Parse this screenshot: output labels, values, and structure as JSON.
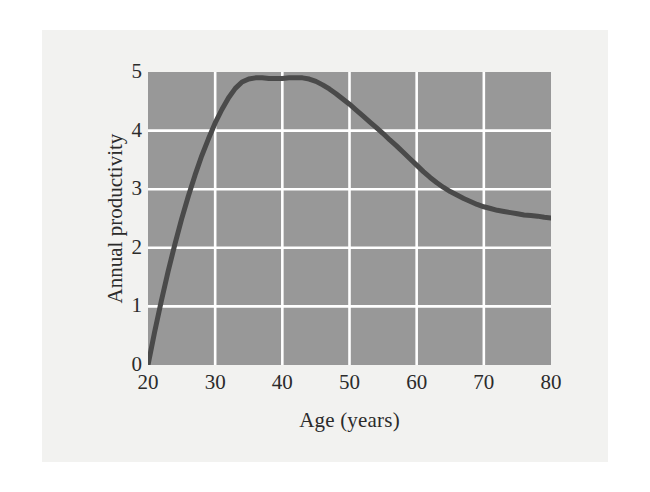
{
  "figure": {
    "background_color": "#f2f2f0",
    "page_color": "#ffffff"
  },
  "chart_data": {
    "type": "line",
    "title": "",
    "subtitle": "",
    "xlabel": "Age (years)",
    "ylabel": "Annual productivity",
    "xlim": [
      20,
      80
    ],
    "ylim": [
      0,
      5
    ],
    "xticks": [
      20,
      30,
      40,
      50,
      60,
      70,
      80
    ],
    "yticks": [
      0,
      1,
      2,
      3,
      4,
      5
    ],
    "xtick_labels": [
      "20",
      "30",
      "40",
      "50",
      "60",
      "70",
      "80"
    ],
    "ytick_labels": [
      "0",
      "1",
      "2",
      "3",
      "4",
      "5"
    ],
    "grid": true,
    "grid_color": "#ffffff",
    "plot_background": "#989898",
    "legend": null,
    "legend_position": "none",
    "annotations": [],
    "series": [
      {
        "name": "Annual productivity",
        "color": "#4a4a4a",
        "line_width": 5,
        "x": [
          20,
          21,
          22,
          23,
          24,
          25,
          26,
          27,
          28,
          29,
          30,
          31,
          32,
          33,
          34,
          35,
          36,
          37,
          38,
          39,
          40,
          41,
          42,
          43,
          44,
          45,
          46,
          47,
          48,
          49,
          50,
          51,
          52,
          53,
          54,
          55,
          56,
          57,
          58,
          59,
          60,
          61,
          62,
          63,
          64,
          65,
          66,
          67,
          68,
          69,
          70,
          71,
          72,
          73,
          74,
          75,
          76,
          77,
          78,
          79,
          80
        ],
        "y": [
          0.0,
          0.57,
          1.1,
          1.6,
          2.06,
          2.49,
          2.88,
          3.24,
          3.57,
          3.86,
          4.13,
          4.36,
          4.56,
          4.72,
          4.83,
          4.88,
          4.9,
          4.9,
          4.89,
          4.89,
          4.89,
          4.9,
          4.9,
          4.9,
          4.88,
          4.84,
          4.78,
          4.71,
          4.63,
          4.54,
          4.45,
          4.35,
          4.25,
          4.15,
          4.05,
          3.95,
          3.84,
          3.74,
          3.63,
          3.52,
          3.41,
          3.3,
          3.2,
          3.11,
          3.03,
          2.96,
          2.9,
          2.84,
          2.79,
          2.74,
          2.7,
          2.67,
          2.64,
          2.62,
          2.6,
          2.58,
          2.56,
          2.55,
          2.54,
          2.52,
          2.51
        ]
      }
    ],
    "peak": {
      "x": 42,
      "y": 4.9
    },
    "start": {
      "x": 20,
      "y": 0
    },
    "end": {
      "x": 80,
      "y": 2.5
    }
  }
}
